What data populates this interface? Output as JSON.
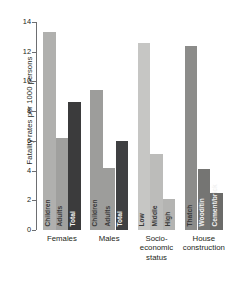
{
  "chart_data": {
    "type": "bar",
    "title": "",
    "subtitle": "",
    "xlabel": "",
    "ylabel": "Fatality rates per 1000 persons",
    "ylim": [
      0,
      14
    ],
    "ytick_labels": [
      "0",
      "2",
      "4",
      "6",
      "8",
      "10",
      "12",
      "14"
    ],
    "ytick_values": [
      0,
      2,
      4,
      6,
      8,
      10,
      12,
      14
    ],
    "grid": false,
    "legend": "none",
    "groups": [
      {
        "name": "Females",
        "label_lines": [
          "Females"
        ],
        "bars": [
          {
            "label": "Children",
            "value": 13.3,
            "color": "#b0b0ae"
          },
          {
            "label": "Adults",
            "value": 6.2,
            "color": "#a0a09e"
          },
          {
            "label": "Total",
            "value": 8.6,
            "color": "#3b3b3c"
          }
        ]
      },
      {
        "name": "Males",
        "label_lines": [
          "Males"
        ],
        "bars": [
          {
            "label": "Children",
            "value": 9.4,
            "color": "#9d9d9b"
          },
          {
            "label": "Adults",
            "value": 4.2,
            "color": "#9d9d9b"
          },
          {
            "label": "Total",
            "value": 6.0,
            "color": "#3f4042"
          }
        ]
      },
      {
        "name": "Socio-economic status",
        "label_lines": [
          "Socio-",
          "economic",
          "status"
        ],
        "bars": [
          {
            "label": "Low",
            "value": 12.6,
            "color": "#c6c6c4"
          },
          {
            "label": "Middle",
            "value": 5.1,
            "color": "#bcbcba"
          },
          {
            "label": "High",
            "value": 2.1,
            "color": "#b4b4b2"
          }
        ]
      },
      {
        "name": "House construction",
        "label_lines": [
          "House",
          "construction"
        ],
        "bars": [
          {
            "label": "Thatch",
            "value": 12.4,
            "color": "#8c8c8a"
          },
          {
            "label": "Wood/tin",
            "value": 4.1,
            "color": "#757573"
          },
          {
            "label": "Cement/brick",
            "value": 2.5,
            "color": "#6b6b69"
          }
        ]
      }
    ]
  },
  "axis": {
    "y_title": "Fatality rates per 1000 persons"
  }
}
